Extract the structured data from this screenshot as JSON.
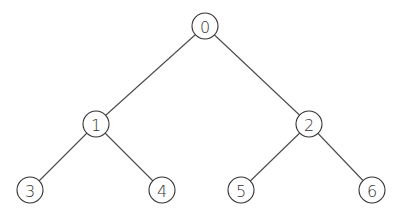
{
  "diagram": {
    "type": "binary-tree",
    "nodes": [
      {
        "id": "0",
        "label": "0",
        "cx": 205,
        "cy": 26
      },
      {
        "id": "1",
        "label": "1",
        "cx": 96,
        "cy": 124
      },
      {
        "id": "2",
        "label": "2",
        "cx": 309,
        "cy": 124
      },
      {
        "id": "3",
        "label": "3",
        "cx": 30,
        "cy": 190
      },
      {
        "id": "4",
        "label": "4",
        "cx": 162,
        "cy": 190
      },
      {
        "id": "5",
        "label": "5",
        "cx": 241,
        "cy": 190
      },
      {
        "id": "6",
        "label": "6",
        "cx": 372,
        "cy": 190
      }
    ],
    "edges": [
      {
        "from": "0",
        "to": "1"
      },
      {
        "from": "0",
        "to": "2"
      },
      {
        "from": "1",
        "to": "3"
      },
      {
        "from": "1",
        "to": "4"
      },
      {
        "from": "2",
        "to": "5"
      },
      {
        "from": "2",
        "to": "6"
      }
    ],
    "node_radius": 13,
    "colors": {
      "edge": "#4a4a4a",
      "node_stroke": "#333333",
      "node_fill": "#ffffff",
      "label": "#333333"
    }
  }
}
